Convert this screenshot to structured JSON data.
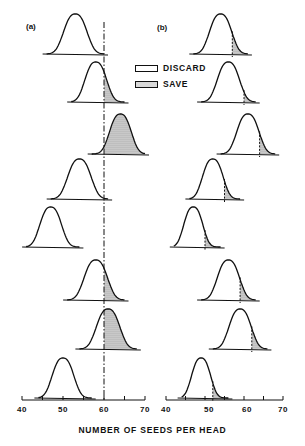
{
  "chart_data": [
    {
      "panel": "a",
      "type": "area",
      "title": "(a)",
      "xlabel": "NUMBER OF SEEDS PER HEAD",
      "xlim": [
        40,
        70
      ],
      "xticks": [
        40,
        45,
        50,
        55,
        60,
        65,
        70
      ],
      "xtick_labels": [
        "40",
        "50",
        "60",
        "70"
      ],
      "grid": false,
      "threshold": {
        "x": 60,
        "style": "dash-dot",
        "spans_all_distributions": true
      },
      "series": [
        {
          "name": "distribution-1",
          "mean": 53,
          "min": 46,
          "max": 60
        },
        {
          "name": "distribution-2",
          "mean": 58,
          "min": 52,
          "max": 65
        },
        {
          "name": "distribution-3",
          "mean": 64,
          "min": 57,
          "max": 70
        },
        {
          "name": "distribution-4",
          "mean": 54,
          "min": 47,
          "max": 61
        },
        {
          "name": "distribution-5",
          "mean": 47,
          "min": 41,
          "max": 54
        },
        {
          "name": "distribution-6",
          "mean": 58,
          "min": 51,
          "max": 65
        },
        {
          "name": "distribution-7",
          "mean": 61,
          "min": 54,
          "max": 68
        },
        {
          "name": "distribution-8",
          "mean": 50,
          "min": 44,
          "max": 57
        }
      ],
      "shading": "area right of threshold (x>60) shaded as SAVE"
    },
    {
      "panel": "b",
      "type": "area",
      "title": "(b)",
      "xlabel": "NUMBER OF SEEDS PER HEAD",
      "xlim": [
        40,
        70
      ],
      "xticks": [
        40,
        45,
        50,
        55,
        60,
        65,
        70
      ],
      "xtick_labels": [
        "40",
        "50",
        "60",
        "70"
      ],
      "grid": false,
      "series": [
        {
          "name": "distribution-1",
          "mean": 54,
          "min": 47,
          "max": 61,
          "cutoff": 57
        },
        {
          "name": "distribution-2",
          "mean": 56,
          "min": 49,
          "max": 63,
          "cutoff": 60
        },
        {
          "name": "distribution-3",
          "mean": 61,
          "min": 54,
          "max": 68,
          "cutoff": 64
        },
        {
          "name": "distribution-4",
          "mean": 52,
          "min": 46,
          "max": 59,
          "cutoff": 55
        },
        {
          "name": "distribution-5",
          "mean": 47,
          "min": 42,
          "max": 54,
          "cutoff": 50
        },
        {
          "name": "distribution-6",
          "mean": 56,
          "min": 49,
          "max": 63,
          "cutoff": 59
        },
        {
          "name": "distribution-7",
          "mean": 59,
          "min": 52,
          "max": 66,
          "cutoff": 62
        },
        {
          "name": "distribution-8",
          "mean": 49,
          "min": 44,
          "max": 56,
          "cutoff": 52
        }
      ],
      "shading": "upper tail of each distribution right of its own cutoff shaded as SAVE"
    }
  ],
  "legend": {
    "position": "upper center",
    "entries": [
      {
        "label": "DISCARD",
        "fill": "none"
      },
      {
        "label": "SAVE",
        "fill": "stippled"
      }
    ]
  },
  "labels": {
    "panel_a": "(a)",
    "panel_b": "(b)",
    "xlabel": "NUMBER OF SEEDS PER HEAD",
    "ticks": [
      "40",
      "50",
      "60",
      "70"
    ]
  },
  "colors": {
    "ink": "#111111",
    "stipple": "#d8d8d8",
    "background": "#ffffff"
  }
}
